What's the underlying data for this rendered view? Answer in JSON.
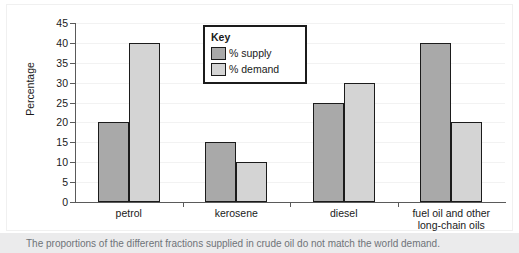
{
  "chart_data": {
    "type": "bar",
    "title": "",
    "xlabel": "",
    "ylabel": "Percentage",
    "ylim": [
      0,
      45
    ],
    "yticks": [
      0,
      5,
      10,
      15,
      20,
      25,
      30,
      35,
      40,
      45
    ],
    "grid": true,
    "legend_position": "inside-top-center",
    "legend_title": "Key",
    "categories": [
      "petrol",
      "kerosene",
      "diesel",
      "fuel oil and other long-chain oils"
    ],
    "series": [
      {
        "name": "% supply",
        "color": "#a9a9a9",
        "values": [
          20,
          15,
          25,
          40
        ]
      },
      {
        "name": "% demand",
        "color": "#d4d4d4",
        "values": [
          40,
          10,
          30,
          20
        ]
      }
    ]
  },
  "axis": {
    "y_label": "Percentage",
    "y_ticks": [
      "45",
      "40",
      "35",
      "30",
      "25",
      "20",
      "15",
      "10",
      "5",
      "0"
    ]
  },
  "categories": [
    {
      "line1": "petrol",
      "line2": ""
    },
    {
      "line1": "kerosene",
      "line2": ""
    },
    {
      "line1": "diesel",
      "line2": ""
    },
    {
      "line1": "fuel oil and other",
      "line2": "long-chain oils"
    }
  ],
  "legend": {
    "title": "Key",
    "items": [
      {
        "label": "% supply"
      },
      {
        "label": "% demand"
      }
    ]
  },
  "caption": {
    "text": "The proportions of the different fractions supplied in crude oil do not match the world demand."
  }
}
